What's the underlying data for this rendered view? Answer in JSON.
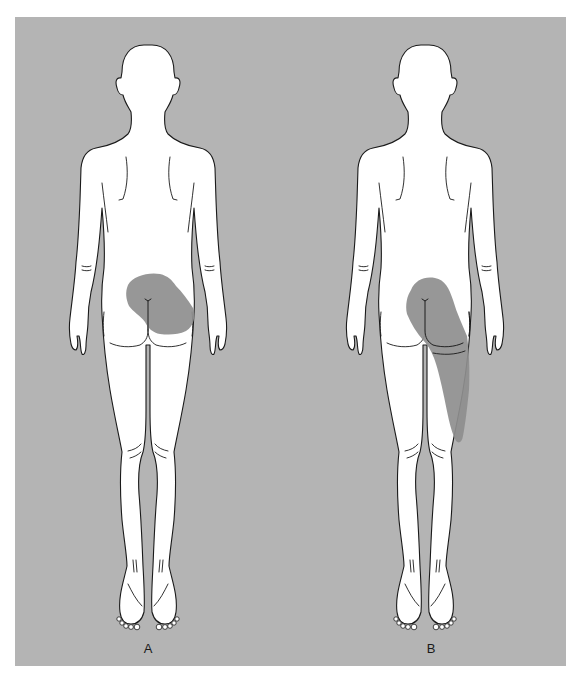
{
  "figure": {
    "background_color": "#b4b4b4",
    "body_color": "#ffffff",
    "shading_color": "#8e8e8e",
    "panels": [
      {
        "label": "A",
        "view": "posterior",
        "shaded_region": "lower back / sacral and right gluteal area"
      },
      {
        "label": "B",
        "view": "posterior",
        "shaded_region": "right gluteal area extending down posterolateral thigh to knee"
      }
    ]
  }
}
